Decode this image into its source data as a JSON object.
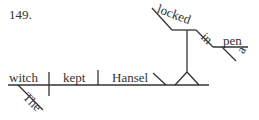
{
  "problem_number": "149.",
  "diagram": {
    "subject": "witch",
    "subject_modifier": "The",
    "verb": "kept",
    "object": "Hansel",
    "participle": "locked",
    "preposition": "in",
    "prep_object": "pen",
    "prep_object_modifier": "a"
  },
  "colors": {
    "line": "#333333",
    "text": "#333333"
  }
}
